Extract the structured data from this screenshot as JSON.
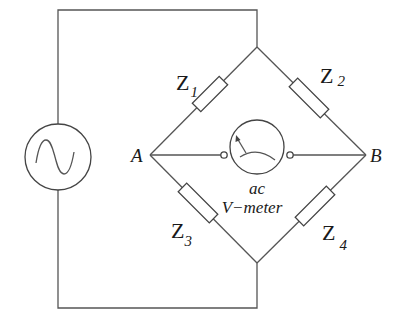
{
  "diagram": {
    "type": "AC bridge circuit",
    "colors": {
      "wire": "#555555",
      "background": "#ffffff",
      "text": "#1a1a1a"
    },
    "nodes": {
      "A": "A",
      "B": "B"
    },
    "impedances": [
      {
        "name": "Z",
        "sub": "1"
      },
      {
        "name": "Z",
        "sub": "2"
      },
      {
        "name": "Z",
        "sub": "3"
      },
      {
        "name": "Z",
        "sub": "4"
      }
    ],
    "meter": {
      "line1": "ac",
      "line2": "V−meter"
    },
    "source": {
      "icon": "ac-source-sine-icon"
    }
  }
}
